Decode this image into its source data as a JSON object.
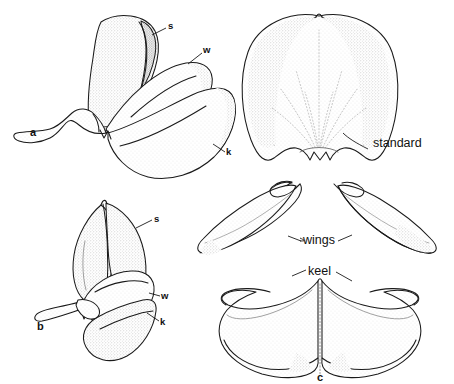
{
  "figure": {
    "background_color": "#ffffff",
    "ink_color": "#1a1a1a",
    "stipple_color": "#9a9a9a",
    "width": 454,
    "height": 384
  },
  "panels": [
    {
      "id": "a",
      "label": "a",
      "caption": "lateral view of intact flower",
      "label_x": 33,
      "label_y": 133
    },
    {
      "id": "b",
      "label": "b",
      "caption": "front view of intact flower",
      "label_x": 40,
      "label_y": 327
    },
    {
      "id": "c",
      "label": "c",
      "caption": "detached wings and keel",
      "label_x": 320,
      "label_y": 377
    }
  ],
  "keys": [
    {
      "key": "s",
      "x": 170,
      "y": 26,
      "panel": "a",
      "meaning": "standard"
    },
    {
      "key": "w",
      "x": 206,
      "y": 50,
      "panel": "a",
      "meaning": "wing"
    },
    {
      "key": "k",
      "x": 229,
      "y": 152,
      "panel": "a",
      "meaning": "keel"
    },
    {
      "key": "s",
      "x": 156,
      "y": 219,
      "panel": "b",
      "meaning": "standard"
    },
    {
      "key": "w",
      "x": 164,
      "y": 296,
      "panel": "b",
      "meaning": "wing"
    },
    {
      "key": "k",
      "x": 163,
      "y": 322,
      "panel": "b",
      "meaning": "keel"
    }
  ],
  "callouts": [
    {
      "text": "standard",
      "x": 373,
      "y": 144,
      "panel": "standard-petal"
    },
    {
      "text": "wings",
      "x": 318,
      "y": 241,
      "panel": "c"
    },
    {
      "text": "keel",
      "x": 320,
      "y": 273,
      "panel": "c"
    }
  ]
}
